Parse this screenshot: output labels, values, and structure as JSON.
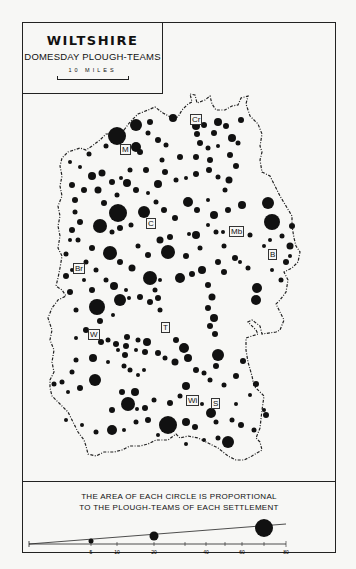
{
  "title": {
    "main": "WILTSHIRE",
    "sub": "DOMESDAY PLOUGH-TEAMS",
    "scale_label": "10 MILES"
  },
  "places": [
    {
      "code": "Cr",
      "x": 190,
      "y": 118
    },
    {
      "code": "M",
      "x": 125,
      "y": 148
    },
    {
      "code": "C",
      "x": 151,
      "y": 222
    },
    {
      "code": "Mb",
      "x": 237,
      "y": 230
    },
    {
      "code": "B",
      "x": 273,
      "y": 254
    },
    {
      "code": "Br",
      "x": 78,
      "y": 267
    },
    {
      "code": "W",
      "x": 92,
      "y": 333
    },
    {
      "code": "T",
      "x": 165,
      "y": 326
    },
    {
      "code": "Wi",
      "x": 192,
      "y": 399
    },
    {
      "code": "S",
      "x": 214,
      "y": 402
    }
  ],
  "legend": {
    "line1": "THE AREA OF EACH CIRCLE IS PROPORTIONAL",
    "line2": "TO THE PLOUGH-TEAMS OF EACH SETTLEMENT",
    "ticks": [
      "5",
      "10",
      "20",
      "40",
      "60",
      "80"
    ],
    "example_circles": [
      5,
      20,
      70
    ]
  },
  "colors": {
    "ink": "#111111",
    "paper": "#f7f7f5"
  }
}
